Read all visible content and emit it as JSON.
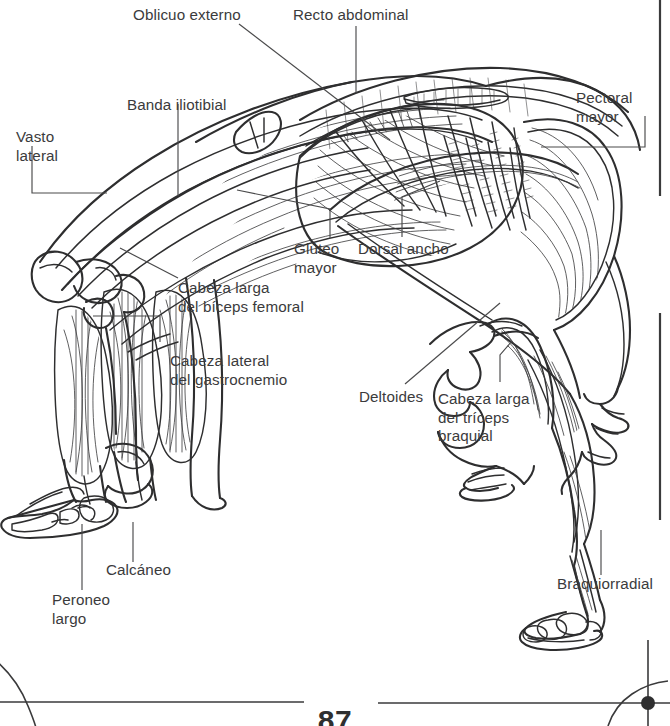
{
  "document": {
    "kind": "anatomy-plate",
    "language": "es",
    "page_number": "87"
  },
  "figure": {
    "title": "",
    "pose": "backbend-wheel-pose",
    "ink_color": "#2e2e2f",
    "text_color": "#3b3b3c",
    "background_color": "#ffffff"
  },
  "labels": [
    {
      "id": "oblicuo-externo",
      "text": "Oblicuo externo",
      "lines": [
        "Oblicuo externo"
      ]
    },
    {
      "id": "recto-abdominal",
      "text": "Recto abdominal",
      "lines": [
        "Recto abdominal"
      ]
    },
    {
      "id": "pectoral-mayor",
      "text": "Pectoral mayor",
      "lines": [
        "Pectoral",
        "mayor"
      ]
    },
    {
      "id": "banda-iliotibial",
      "text": "Banda iliotibial",
      "lines": [
        "Banda iliotibial"
      ]
    },
    {
      "id": "vasto-lateral",
      "text": "Vasto lateral",
      "lines": [
        "Vasto",
        "lateral"
      ]
    },
    {
      "id": "gluteo-mayor",
      "text": "Glúteo mayor",
      "lines": [
        "Glúteo",
        "mayor"
      ]
    },
    {
      "id": "dorsal-ancho",
      "text": "Dorsal ancho",
      "lines": [
        "Dorsal ancho"
      ]
    },
    {
      "id": "cabeza-larga-biceps-femoral",
      "text": "Cabeza larga del bíceps femoral",
      "lines": [
        "Cabeza larga",
        "del bíceps femoral"
      ]
    },
    {
      "id": "cabeza-lateral-gastrocnemio",
      "text": "Cabeza lateral del gastrocnemio",
      "lines": [
        "Cabeza lateral",
        "del gastrocnemio"
      ]
    },
    {
      "id": "deltoides",
      "text": "Deltoides",
      "lines": [
        "Deltoides"
      ]
    },
    {
      "id": "cabeza-larga-triceps-braquial",
      "text": "Cabeza larga del tríceps braquial",
      "lines": [
        "Cabeza larga",
        "del tríceps",
        "braquial"
      ]
    },
    {
      "id": "calcaneo",
      "text": "Calcáneo",
      "lines": [
        "Calcáneo"
      ]
    },
    {
      "id": "peroneo-largo",
      "text": "Peroneo largo",
      "lines": [
        "Peroneo",
        "largo"
      ]
    },
    {
      "id": "braquiorradial",
      "text": "Braquiorradial",
      "lines": [
        "Braquiorradial"
      ]
    }
  ]
}
